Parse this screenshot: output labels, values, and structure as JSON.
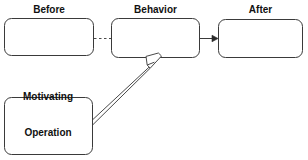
{
  "diagram": {
    "type": "flow-diagram",
    "canvas": {
      "width": 308,
      "height": 160,
      "background": "#ffffff"
    },
    "style": {
      "box_stroke": "#3a3a3a",
      "box_fill": "#ffffff",
      "connector_stroke": "#4a4a4a",
      "label_color": "#111111",
      "stroke_width": 1,
      "corner_radius": 7
    },
    "nodes": [
      {
        "id": "before",
        "label": "Before",
        "shape": "rounded-rectangle",
        "content": "",
        "x": 4,
        "y": 18,
        "width": 90,
        "height": 38,
        "label_position": "above"
      },
      {
        "id": "behavior",
        "label": "Behavior",
        "shape": "rounded-rectangle",
        "content": "",
        "x": 111,
        "y": 18,
        "width": 89,
        "height": 40,
        "label_position": "above"
      },
      {
        "id": "after",
        "label": "After",
        "shape": "rounded-rectangle",
        "content": "",
        "x": 218,
        "y": 19,
        "width": 85,
        "height": 39,
        "label_position": "above"
      },
      {
        "id": "motivating-operation",
        "label": "Motivating\nOperation",
        "label_line_1": "Motivating",
        "label_line_2": "Operation",
        "shape": "rounded-rectangle",
        "content": "",
        "x": 4,
        "y": 97,
        "width": 89,
        "height": 58,
        "label_position": "above"
      }
    ],
    "connectors": [
      {
        "id": "before-to-behavior",
        "from": "before",
        "to": "behavior",
        "line_style": "dashed",
        "arrowhead": "none",
        "x1": 94,
        "y1": 38,
        "x2": 111,
        "y2": 38
      },
      {
        "id": "behavior-to-after",
        "from": "behavior",
        "to": "after",
        "line_style": "solid",
        "arrowhead": "filled-triangle",
        "x1": 200,
        "y1": 38,
        "x2": 218,
        "y2": 38
      },
      {
        "id": "mo-to-behavior",
        "from": "motivating-operation",
        "to": "behavior",
        "line_style": "hollow-double-line",
        "arrowhead": "open-outline",
        "x1": 93,
        "y1": 122,
        "x2": 160,
        "y2": 57
      }
    ]
  }
}
